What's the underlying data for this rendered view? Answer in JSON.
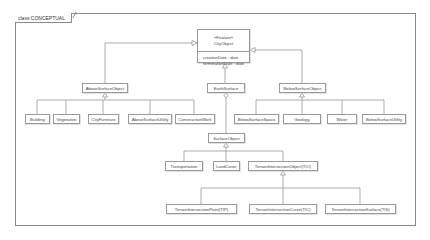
{
  "frame": {
    "title": "class CONCEPTUAL"
  },
  "root": {
    "stereotype": "«Feature»",
    "name": "CityObject",
    "attributes": [
      "creationDate : date",
      "terminationDate : date"
    ]
  },
  "level1": {
    "above": "AboveSurfaceObject",
    "earth": "EarthSurface",
    "below": "BelowSurfaceObject"
  },
  "above_children": [
    "Building",
    "Vegetation",
    "CityFurniture",
    "AboveSurfaceUtility",
    "ConstructionWork"
  ],
  "below_children": [
    "BelowSurfaceSpace",
    "Geology",
    "Water",
    "BelowSurfaceUtility"
  ],
  "surface": {
    "name": "SurfaceObject"
  },
  "surface_children": [
    "Transportation",
    "LandCover",
    "TerrainIntersectionObject(TIO)"
  ],
  "tio_children": [
    "TerrainIntersectionPoint(TIP)",
    "TerrainIntersectionCurve(TIC)",
    "TerrainIntersectionSurface(TIS)"
  ],
  "colors": {
    "line": "#8a8a8a",
    "box_border": "#9a9a9a",
    "text": "#444444"
  }
}
